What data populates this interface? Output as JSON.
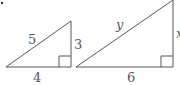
{
  "figure": {
    "bullet": ".",
    "triangle_left": {
      "hypotenuse": "5",
      "vertical_leg": "3",
      "horizontal_leg": "4"
    },
    "triangle_right": {
      "hypotenuse": "y",
      "vertical_leg": "x",
      "horizontal_leg": "6"
    },
    "colors": {
      "line": "#444444",
      "text": "#555555"
    }
  }
}
